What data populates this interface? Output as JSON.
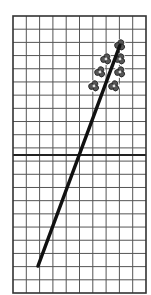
{
  "figure": {
    "type": "grid-diagram",
    "background": "#ffffff",
    "grid": {
      "x0": 13,
      "y0": 16,
      "x1": 146,
      "y1": 293,
      "columns": 10,
      "rows": 21,
      "line_color": "#555555",
      "frame_color": "#333333",
      "midline_y": 155,
      "midline_color": "#222222"
    },
    "trend_line": {
      "x1": 38,
      "y1": 266,
      "x2": 120,
      "y2": 45,
      "color": "#111111",
      "width": 3.5
    },
    "markers": {
      "shape": "rosette",
      "color": "#555555",
      "outline": "#222222",
      "points": [
        {
          "x": 120,
          "y": 45
        },
        {
          "x": 106,
          "y": 59
        },
        {
          "x": 120,
          "y": 59
        },
        {
          "x": 100,
          "y": 72
        },
        {
          "x": 120,
          "y": 72
        },
        {
          "x": 94,
          "y": 86
        },
        {
          "x": 114,
          "y": 86
        }
      ]
    }
  }
}
